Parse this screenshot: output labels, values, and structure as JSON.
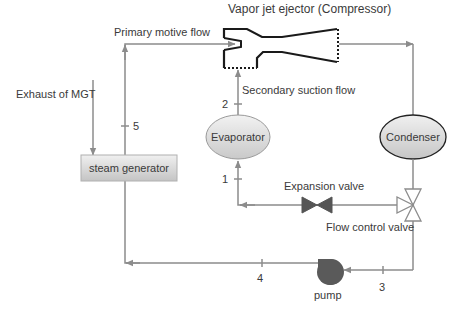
{
  "diagram": {
    "title": "Vapor jet ejector (Compressor)",
    "labels": {
      "primary_motive_flow": "Primary motive flow",
      "secondary_suction_flow": "Secondary suction flow",
      "exhaust_of_mgt": "Exhaust of MGT",
      "expansion_valve": "Expansion valve",
      "flow_control_valve": "Flow control valve",
      "pump": "pump"
    },
    "nodes": {
      "evaporator": "Evaporator",
      "condenser": "Condenser",
      "steam_generator": "steam generator"
    },
    "state_points": {
      "p1": "1",
      "p2": "2",
      "p3": "3",
      "p4": "4",
      "p5": "5"
    },
    "colors": {
      "line": "#8c8c8c",
      "outline_dark": "#1a1a1a",
      "node_fill_light": "#eeeeee",
      "node_fill_dark": "#c8c8c8",
      "valve_fill": "#555555",
      "pump_fill": "#5a5a5a"
    }
  }
}
